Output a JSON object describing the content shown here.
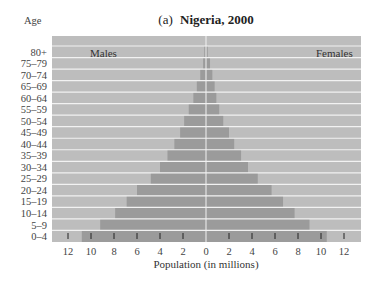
{
  "chart_data": {
    "type": "bar",
    "subtype": "population-pyramid",
    "title_prefix": "(a)",
    "title": "Nigeria, 2000",
    "ylabel": "Age",
    "xlabel": "Population (in millions)",
    "left_series_label": "Males",
    "right_series_label": "Females",
    "xlim": [
      -13,
      13
    ],
    "xticks": [
      -12,
      -10,
      -8,
      -6,
      -4,
      -2,
      0,
      2,
      4,
      6,
      8,
      10,
      12
    ],
    "xtick_labels": [
      "12",
      "10",
      "8",
      "6",
      "4",
      "2",
      "0",
      "2",
      "4",
      "6",
      "8",
      "10",
      "12"
    ],
    "categories": [
      "80+",
      "75–79",
      "70–74",
      "65–69",
      "60–64",
      "55–59",
      "50–54",
      "45–49",
      "40–44",
      "35–39",
      "30–34",
      "25–29",
      "20–24",
      "15–19",
      "10–14",
      "5–9",
      "0–4"
    ],
    "series": [
      {
        "name": "Males",
        "values": [
          0.15,
          0.25,
          0.5,
          0.8,
          1.1,
          1.5,
          1.9,
          2.25,
          2.75,
          3.35,
          4.0,
          4.8,
          6.0,
          6.9,
          7.9,
          9.2,
          10.8
        ]
      },
      {
        "name": "Females",
        "values": [
          0.15,
          0.35,
          0.55,
          0.75,
          0.9,
          1.15,
          1.5,
          2.0,
          2.45,
          3.05,
          3.65,
          4.5,
          5.7,
          6.7,
          7.7,
          9.0,
          10.5
        ]
      }
    ],
    "grid": true,
    "colors": {
      "plot_bg": "#bdbdbd",
      "bar": "#9b9b9b",
      "gridline": "#f2f2f2"
    }
  }
}
